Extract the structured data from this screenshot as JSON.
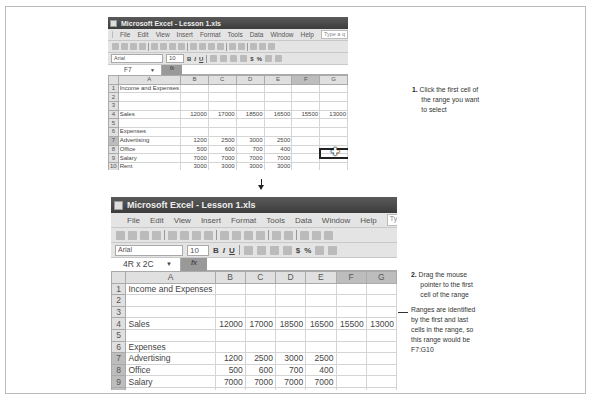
{
  "window1": {
    "title": "Microsoft Excel - Lesson 1.xls",
    "menu": [
      "File",
      "Edit",
      "View",
      "Insert",
      "Format",
      "Tools",
      "Data",
      "Window",
      "Help"
    ],
    "help_placeholder": "Type a q",
    "font": "Arial",
    "font_size": "10",
    "name_box": "F7",
    "fx": "fx",
    "columns": [
      "A",
      "B",
      "C",
      "D",
      "E",
      "F",
      "G"
    ],
    "rows": [
      {
        "n": "1",
        "cells": [
          "Income and Expenses",
          "",
          "",
          "",
          "",
          "",
          ""
        ]
      },
      {
        "n": "2",
        "cells": [
          "",
          "",
          "",
          "",
          "",
          "",
          ""
        ]
      },
      {
        "n": "3",
        "cells": [
          "",
          "",
          "",
          "",
          "",
          "",
          ""
        ]
      },
      {
        "n": "4",
        "cells": [
          "Sales",
          "12000",
          "17000",
          "18500",
          "16500",
          "15500",
          "13000"
        ]
      },
      {
        "n": "5",
        "cells": [
          "",
          "",
          "",
          "",
          "",
          "",
          ""
        ]
      },
      {
        "n": "6",
        "cells": [
          "Expenses",
          "",
          "",
          "",
          "",
          "",
          ""
        ]
      },
      {
        "n": "7",
        "cells": [
          "Advertising",
          "1200",
          "2500",
          "3000",
          "2500",
          "",
          ""
        ]
      },
      {
        "n": "8",
        "cells": [
          "Office",
          "500",
          "600",
          "700",
          "400",
          "",
          ""
        ]
      },
      {
        "n": "9",
        "cells": [
          "Salary",
          "7000",
          "7000",
          "7000",
          "7000",
          "",
          ""
        ]
      },
      {
        "n": "10",
        "cells": [
          "Rent",
          "3000",
          "3000",
          "3000",
          "3000",
          "",
          ""
        ]
      },
      {
        "n": "11",
        "cells": [
          "Totals",
          "",
          "",
          "",
          "",
          "",
          ""
        ]
      }
    ]
  },
  "window2": {
    "title": "Microsoft Excel - Lesson 1.xls",
    "menu": [
      "File",
      "Edit",
      "View",
      "Insert",
      "Format",
      "Tools",
      "Data",
      "Window",
      "Help"
    ],
    "help_placeholder": "Type a q",
    "font": "Arial",
    "font_size": "10",
    "name_box": "4R x 2C",
    "fx": "fx",
    "columns": [
      "A",
      "B",
      "C",
      "D",
      "E",
      "F",
      "G"
    ],
    "rows": [
      {
        "n": "1",
        "cells": [
          "Income and Expenses",
          "",
          "",
          "",
          "",
          "",
          ""
        ]
      },
      {
        "n": "2",
        "cells": [
          "",
          "",
          "",
          "",
          "",
          "",
          ""
        ]
      },
      {
        "n": "3",
        "cells": [
          "",
          "",
          "",
          "",
          "",
          "",
          ""
        ]
      },
      {
        "n": "4",
        "cells": [
          "Sales",
          "12000",
          "17000",
          "18500",
          "16500",
          "15500",
          "13000"
        ]
      },
      {
        "n": "5",
        "cells": [
          "",
          "",
          "",
          "",
          "",
          "",
          ""
        ]
      },
      {
        "n": "6",
        "cells": [
          "Expenses",
          "",
          "",
          "",
          "",
          "",
          ""
        ]
      },
      {
        "n": "7",
        "cells": [
          "Advertising",
          "1200",
          "2500",
          "3000",
          "2500",
          "",
          ""
        ]
      },
      {
        "n": "8",
        "cells": [
          "Office",
          "500",
          "600",
          "700",
          "400",
          "",
          ""
        ]
      },
      {
        "n": "9",
        "cells": [
          "Salary",
          "7000",
          "7000",
          "7000",
          "7000",
          "",
          ""
        ]
      },
      {
        "n": "10",
        "cells": [
          "Rent",
          "3000",
          "3000",
          "3000",
          "3000",
          "",
          ""
        ]
      }
    ]
  },
  "format_buttons": [
    "B",
    "I",
    "U",
    "$",
    "%"
  ],
  "steps": {
    "step1_num": "1.",
    "step1_line1": "Click the first cell of",
    "step1_line2": "the range you want",
    "step1_line3": "to select",
    "step2_num": "2.",
    "step2_line1": "Drag the mouse",
    "step2_line2": "pointer to the first",
    "step2_line3": "cell of the range",
    "note_line1": "Ranges are identified",
    "note_line2": "by the first and last",
    "note_line3": "cells in the range, so",
    "note_line4": "this range would be",
    "note_line5": "F7:G10"
  }
}
